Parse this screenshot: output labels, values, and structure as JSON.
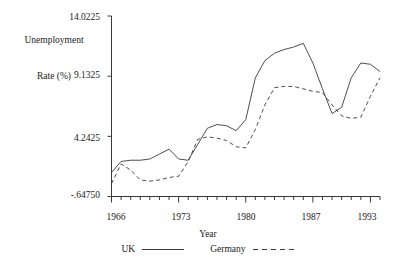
{
  "chart_data": {
    "type": "line",
    "title": "",
    "ylabel": "Unemployment\nRate (%)",
    "xlabel": "Year",
    "ylabel_line1": "Unemployment",
    "ylabel_line2": "Rate (%)",
    "xlim": [
      1966,
      1994
    ],
    "ylim": [
      -0.6475,
      14.0225
    ],
    "yticks": [
      14.0225,
      9.1325,
      4.2425,
      -0.6475
    ],
    "ytick_labels": [
      "14.0225",
      "9.1325",
      "4.2425",
      "-.64750"
    ],
    "xticks": [
      1966,
      1973,
      1980,
      1987,
      1993
    ],
    "xtick_labels": [
      "1966",
      "1973",
      "1980",
      "1987",
      "1993"
    ],
    "x_minor_tick_interval": 1,
    "grid": false,
    "legend_position": "bottom-center",
    "axis_color": "#3a3a3a",
    "series": [
      {
        "name": "UK",
        "style": "solid",
        "color": "#3a3a3a",
        "x": [
          1966,
          1967,
          1968,
          1969,
          1970,
          1971,
          1972,
          1973,
          1974,
          1975,
          1976,
          1977,
          1978,
          1979,
          1980,
          1981,
          1982,
          1983,
          1984,
          1985,
          1986,
          1987,
          1988,
          1989,
          1990,
          1991,
          1992,
          1993,
          1994
        ],
        "values": [
          1.3,
          2.2,
          2.3,
          2.3,
          2.4,
          2.8,
          3.2,
          2.4,
          2.3,
          3.6,
          4.9,
          5.2,
          5.1,
          4.7,
          5.6,
          9.0,
          10.4,
          11.0,
          11.3,
          11.5,
          11.8,
          10.2,
          8.1,
          6.1,
          6.6,
          9.0,
          10.2,
          10.1,
          9.5
        ],
        "approx_from": "read off axis"
      },
      {
        "name": "Germany",
        "style": "dashed",
        "color": "#3a3a3a",
        "x": [
          1966,
          1967,
          1968,
          1969,
          1970,
          1971,
          1972,
          1973,
          1974,
          1975,
          1976,
          1977,
          1978,
          1979,
          1980,
          1981,
          1982,
          1983,
          1984,
          1985,
          1986,
          1987,
          1988,
          1989,
          1990,
          1991,
          1992,
          1993,
          1994
        ],
        "values": [
          0.4,
          2.0,
          1.5,
          0.7,
          0.6,
          0.7,
          0.9,
          1.0,
          2.2,
          4.0,
          4.2,
          4.1,
          3.9,
          3.4,
          3.3,
          4.8,
          6.8,
          8.2,
          8.3,
          8.3,
          8.1,
          7.9,
          7.8,
          6.8,
          5.9,
          5.7,
          5.8,
          7.5,
          9.0
        ],
        "approx_from": "read off axis"
      }
    ]
  },
  "legend": {
    "entries": [
      {
        "label": "UK",
        "style": "solid"
      },
      {
        "label": "Germany",
        "style": "dashed"
      }
    ]
  }
}
